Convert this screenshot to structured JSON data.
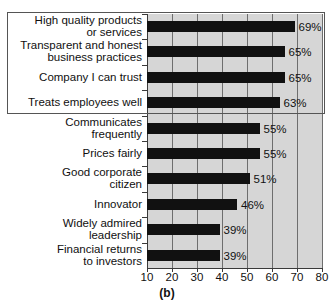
{
  "chart_data": {
    "type": "bar",
    "orientation": "horizontal",
    "title": "",
    "caption": "(b)",
    "xlabel": "",
    "ylabel": "",
    "xlim": [
      10,
      80
    ],
    "xticks": [
      10,
      20,
      30,
      40,
      50,
      60,
      70,
      80
    ],
    "xtick_labels": [
      "10",
      "20",
      "30",
      "40",
      "50",
      "60",
      "70",
      "80"
    ],
    "grid": true,
    "grid_axis": "x",
    "legend": false,
    "value_suffix": "%",
    "bar_color": "#111111",
    "plot_background": "#d6d6d6",
    "gridline_color": "#6e6e6e",
    "categories": [
      "High quality products or services",
      "Transparent and honest business practices",
      "Company I can trust",
      "Treats employees well",
      "Communicates frequently",
      "Prices fairly",
      "Good corporate citizen",
      "Innovator",
      "Widely admired leadership",
      "Financial returns to investors"
    ],
    "values": [
      69,
      65,
      65,
      63,
      55,
      55,
      51,
      46,
      39,
      39
    ],
    "value_labels": [
      "69%",
      "65%",
      "65%",
      "63%",
      "55%",
      "55%",
      "51%",
      "46%",
      "39%",
      "39%"
    ],
    "highlighted_categories": [
      "High quality products or services",
      "Transparent and honest business practices",
      "Company I can trust",
      "Treats employees well"
    ]
  },
  "rows": [
    {
      "label_line1": "High quality products",
      "label_line2": "or services",
      "value": 69,
      "value_label": "69%",
      "highlighted": true
    },
    {
      "label_line1": "Transparent and honest",
      "label_line2": "business practices",
      "value": 65,
      "value_label": "65%",
      "highlighted": true
    },
    {
      "label_line1": "Company I can trust",
      "label_line2": "",
      "value": 65,
      "value_label": "65%",
      "highlighted": true
    },
    {
      "label_line1": "Treats employees well",
      "label_line2": "",
      "value": 63,
      "value_label": "63%",
      "highlighted": true
    },
    {
      "label_line1": "Communicates",
      "label_line2": "frequently",
      "value": 55,
      "value_label": "55%",
      "highlighted": false
    },
    {
      "label_line1": "Prices fairly",
      "label_line2": "",
      "value": 55,
      "value_label": "55%",
      "highlighted": false
    },
    {
      "label_line1": "Good corporate",
      "label_line2": "citizen",
      "value": 51,
      "value_label": "51%",
      "highlighted": false
    },
    {
      "label_line1": "Innovator",
      "label_line2": "",
      "value": 46,
      "value_label": "46%",
      "highlighted": false
    },
    {
      "label_line1": "Widely admired",
      "label_line2": "leadership",
      "value": 39,
      "value_label": "39%",
      "highlighted": false
    },
    {
      "label_line1": "Financial returns",
      "label_line2": "to investors",
      "value": 39,
      "value_label": "39%",
      "highlighted": false
    }
  ],
  "caption": "(b)"
}
